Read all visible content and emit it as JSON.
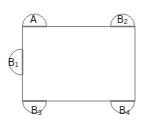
{
  "diagram": {
    "type": "rectangle-with-semicircles",
    "rectangle": {
      "x": 22,
      "y": 26,
      "width": 113,
      "height": 75
    },
    "semicircles": [
      {
        "id": "A",
        "label": "A",
        "subscript": "",
        "side": "top",
        "cx": 34.5,
        "cy": 26,
        "r": 12
      },
      {
        "id": "B2",
        "label": "B",
        "subscript": "2",
        "side": "top",
        "cx": 122.5,
        "cy": 26,
        "r": 12
      },
      {
        "id": "B1",
        "label": "B",
        "subscript": "1",
        "side": "left",
        "cx": 22,
        "cy": 62,
        "r": 13
      },
      {
        "id": "B3",
        "label": "B",
        "subscript": "3",
        "side": "bottom",
        "cx": 34.5,
        "cy": 101,
        "r": 12
      },
      {
        "id": "B4",
        "label": "B",
        "subscript": "4",
        "side": "bottom",
        "cx": 122.5,
        "cy": 101,
        "r": 12
      }
    ],
    "colors": {
      "stroke": "#888888",
      "text": "#222222"
    }
  },
  "labels": {
    "A": {
      "main": "A",
      "sub": ""
    },
    "B1": {
      "main": "B",
      "sub": "1"
    },
    "B2": {
      "main": "B",
      "sub": "2"
    },
    "B3": {
      "main": "B",
      "sub": "3"
    },
    "B4": {
      "main": "B",
      "sub": "4"
    }
  }
}
